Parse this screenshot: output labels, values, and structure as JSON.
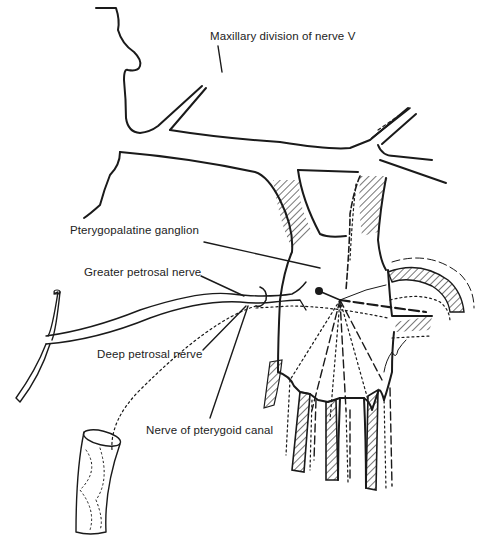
{
  "figure": {
    "type": "anatomical line drawing",
    "ink_color": "#1a1a1a",
    "background": "#ffffff"
  },
  "labels": [
    {
      "id": "maxillary",
      "text": "Maxillary division of nerve V",
      "x": 210,
      "y": 36
    },
    {
      "id": "ganglion",
      "text": "Pterygopalatine ganglion",
      "x": 70,
      "y": 231
    },
    {
      "id": "greater-petrosal",
      "text": "Greater petrosal nerve",
      "x": 84,
      "y": 266
    },
    {
      "id": "deep-petrosal",
      "text": "Deep petrosal nerve",
      "x": 97,
      "y": 345
    },
    {
      "id": "pterygoid-canal",
      "text": "Nerve of pterygoid canal",
      "x": 146,
      "y": 421
    }
  ],
  "signature": "artist signature (illegible)"
}
